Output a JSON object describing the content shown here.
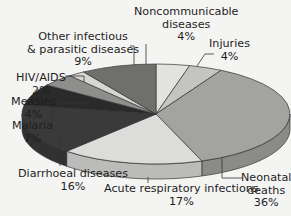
{
  "chart_data": {
    "type": "pie",
    "style": "3d",
    "title": "",
    "slices": [
      {
        "label": "Noncommunicable diseases",
        "value": 4,
        "color": "#e2e2e0"
      },
      {
        "label": "Injuries",
        "value": 4,
        "color": "#c4c4c2"
      },
      {
        "label": "Neonatal deaths",
        "value": 36,
        "color": "#a3a3a1"
      },
      {
        "label": "Acute respiratory infections",
        "value": 17,
        "color": "#dcdcda"
      },
      {
        "label": "Diarrhoeal diseases",
        "value": 16,
        "color": "#3a3a3a"
      },
      {
        "label": "Malaria",
        "value": 7,
        "color": "#2a2a2a"
      },
      {
        "label": "Measles",
        "value": 4,
        "color": "#8e8e8c"
      },
      {
        "label": "HIV/AIDS",
        "value": 2,
        "color": "#d6d6d4"
      },
      {
        "label": "Other infectious & parasitic diseases",
        "value": 9,
        "color": "#6f6f6d"
      }
    ]
  },
  "labels": {
    "noncomm": {
      "line1": "Noncommunicable",
      "line2": "diseases",
      "pct": "4%"
    },
    "injuries": {
      "line1": "Injuries",
      "pct": "4%"
    },
    "other": {
      "line1": "Other infectious",
      "line2": "& parasitic diseases",
      "pct": "9%"
    },
    "hiv": {
      "line1": "HIV/AIDS",
      "pct": "2%"
    },
    "measles": {
      "line1": "Measles",
      "pct": "4%"
    },
    "malaria": {
      "line1": "Malaria",
      "pct": "7%"
    },
    "diarrhoeal": {
      "line1": "Diarrhoeal diseases",
      "pct": "16%"
    },
    "acute": {
      "line1": "Acute respiratory infections",
      "pct": "17%"
    },
    "neonatal": {
      "line1": "Neonatal",
      "line2": "deaths",
      "pct": "36%"
    }
  }
}
